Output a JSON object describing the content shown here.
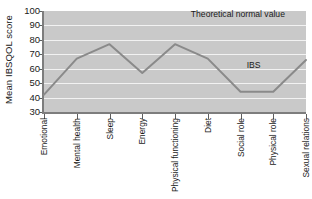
{
  "chart_data": {
    "type": "line",
    "title": "",
    "xlabel": "",
    "ylabel": "Mean IBSQOL score",
    "ylim": [
      30,
      100
    ],
    "yticks": [
      100,
      90,
      80,
      70,
      60,
      50,
      40,
      30
    ],
    "grid": true,
    "legend": "none",
    "categories": [
      "Emotional",
      "Mental health",
      "Sleep",
      "Energy",
      "Physical functioning",
      "Diet",
      "Social role",
      "Physical role",
      "Sexual relations"
    ],
    "series": [
      {
        "name": "IBS",
        "color": "#8a8a8a",
        "values": [
          42,
          67,
          77,
          57,
          77,
          67,
          44,
          44,
          66
        ]
      }
    ],
    "annotations": [
      {
        "text": "Theoretical normal value",
        "x_frac": 0.74,
        "y_value": 97
      },
      {
        "text": "IBS",
        "x_frac": 0.8,
        "y_value": 62
      }
    ],
    "plot_background": "#c9c9c9",
    "gridline_color": "#f2f2f2",
    "axis_color": "#7d7d7d"
  }
}
